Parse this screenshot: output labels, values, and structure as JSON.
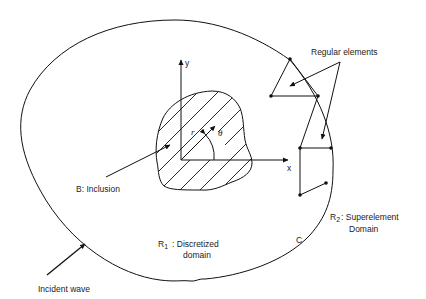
{
  "labels": {
    "regular_elements": "Regular elements",
    "inclusion": "B: Inclusion",
    "r1_symbol": "R",
    "r1_sub": "1",
    "r1_line1": ": Discretized",
    "r1_line2": "domain",
    "r2_symbol": "R",
    "r2_sub": "2",
    "r2_line1": ": Superelement",
    "r2_line2": "Domain",
    "boundary_c": "C",
    "incident_wave": "Incident wave",
    "axis_x": "x",
    "axis_y": "y",
    "radius": "r",
    "theta": "θ"
  },
  "colors": {
    "ink": "#111111",
    "background": "#ffffff"
  }
}
